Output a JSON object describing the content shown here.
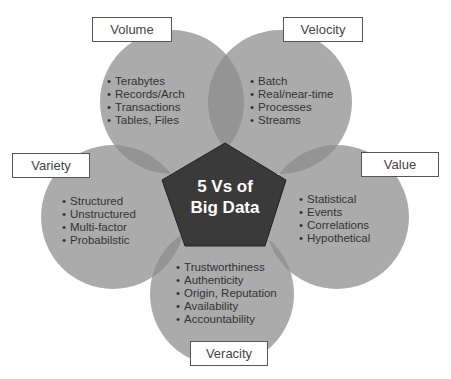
{
  "title": "5 Vs of Big Data",
  "center": {
    "line1": "5 Vs of",
    "line2": "Big Data"
  },
  "colors": {
    "circle": "#8a8a8a",
    "pentagon": "#3a3a3a",
    "label_border": "#555555",
    "text": "#333333"
  },
  "vs": [
    {
      "name": "Volume",
      "items": [
        "Terabytes",
        "Records/Arch",
        "Transactions",
        "Tables, Files"
      ]
    },
    {
      "name": "Velocity",
      "items": [
        "Batch",
        "Real/near-time",
        "Processes",
        "Streams"
      ]
    },
    {
      "name": "Variety",
      "items": [
        "Structured",
        "Unstructured",
        "Multi-factor",
        "Probabilstic"
      ]
    },
    {
      "name": "Value",
      "items": [
        "Statistical",
        "Events",
        "Correlations",
        "Hypothetical"
      ]
    },
    {
      "name": "Veracity",
      "items": [
        "Trustworthiness",
        "Authenticity",
        "Origin, Reputation",
        "Availability",
        "Accountability"
      ]
    }
  ]
}
